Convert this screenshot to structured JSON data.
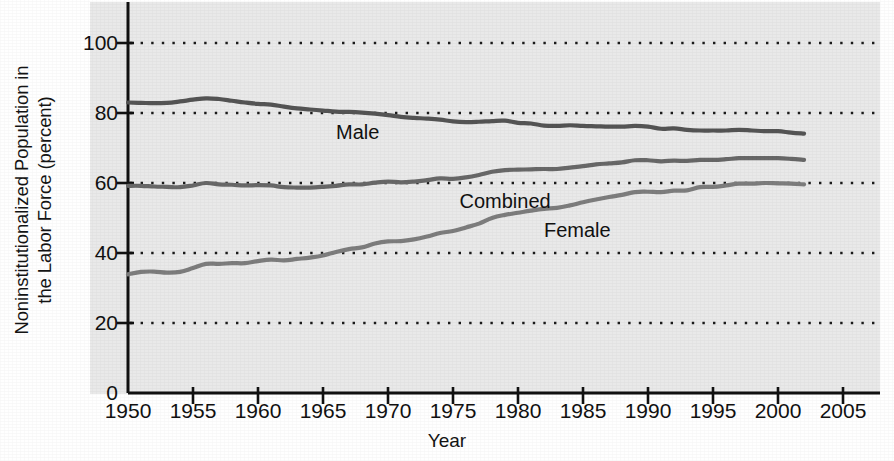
{
  "chart_data": {
    "type": "line",
    "title": "",
    "subtitle": "",
    "xlabel": "Year",
    "ylabel_line1": "Noninstitutionalized Population in",
    "ylabel_line2": "the Labor Force (percent)",
    "ylabel": "Noninstitutionalized Population in the Labor Force (percent)",
    "xlim": [
      1950,
      2005
    ],
    "ylim": [
      0,
      108
    ],
    "xticks": [
      1950,
      1955,
      1960,
      1965,
      1970,
      1975,
      1980,
      1985,
      1990,
      1995,
      2000,
      2005
    ],
    "xtick_labels": [
      "1950",
      "1955",
      "1960",
      "1965",
      "1970",
      "1975",
      "1980",
      "1985",
      "1990",
      "1995",
      "2000",
      "2005"
    ],
    "yticks": [
      0,
      20,
      40,
      60,
      80,
      100
    ],
    "ytick_labels": [
      "0",
      "20",
      "40",
      "60",
      "80",
      "100"
    ],
    "grid": true,
    "grid_style": "dotted",
    "grid_axis": "y",
    "grid_values": [
      20,
      40,
      60,
      80,
      100
    ],
    "legend_position": "inline-annotations",
    "plot_background": "#e9e9e9",
    "figure_background": "#ffffff",
    "x": [
      1950,
      1951,
      1952,
      1953,
      1954,
      1955,
      1956,
      1957,
      1958,
      1959,
      1960,
      1961,
      1962,
      1963,
      1964,
      1965,
      1966,
      1967,
      1968,
      1969,
      1970,
      1971,
      1972,
      1973,
      1974,
      1975,
      1976,
      1977,
      1978,
      1979,
      1980,
      1981,
      1982,
      1983,
      1984,
      1985,
      1986,
      1987,
      1988,
      1989,
      1990,
      1991,
      1992,
      1993,
      1994,
      1995,
      1996,
      1997,
      1998,
      1999,
      2000,
      2001,
      2002
    ],
    "series": [
      {
        "name": "Male",
        "color": "#545454",
        "label_text": "Male",
        "label_x": 1966,
        "label_y": 74.5,
        "values": [
          83.0,
          82.9,
          82.8,
          82.9,
          83.3,
          83.8,
          84.2,
          84.0,
          83.5,
          83.0,
          82.6,
          82.4,
          81.8,
          81.3,
          81.0,
          80.7,
          80.4,
          80.3,
          80.1,
          79.8,
          79.4,
          78.9,
          78.6,
          78.4,
          78.1,
          77.6,
          77.4,
          77.5,
          77.7,
          77.8,
          77.2,
          77.0,
          76.4,
          76.3,
          76.5,
          76.3,
          76.2,
          76.1,
          76.1,
          76.3,
          76.1,
          75.5,
          75.6,
          75.2,
          75.0,
          75.0,
          75.0,
          75.2,
          75.0,
          74.8,
          74.8,
          74.4,
          74.1
        ],
        "style": "solid",
        "linewidth": 4.2
      },
      {
        "name": "Combined",
        "color": "#686868",
        "label_text": "Combined",
        "label_x": 1975.5,
        "label_y": 55.0,
        "values": [
          59.2,
          59.2,
          59.0,
          58.9,
          58.8,
          59.3,
          60.0,
          59.6,
          59.5,
          59.3,
          59.4,
          59.3,
          58.8,
          58.7,
          58.7,
          58.9,
          59.2,
          59.6,
          59.6,
          60.1,
          60.4,
          60.2,
          60.4,
          60.8,
          61.3,
          61.2,
          61.6,
          62.3,
          63.2,
          63.7,
          63.8,
          63.9,
          64.0,
          64.0,
          64.4,
          64.8,
          65.3,
          65.6,
          65.9,
          66.5,
          66.5,
          66.2,
          66.4,
          66.3,
          66.6,
          66.6,
          66.8,
          67.1,
          67.1,
          67.1,
          67.1,
          66.9,
          66.6
        ],
        "style": "solid",
        "linewidth": 4.2
      },
      {
        "name": "Female",
        "color": "#7d7d7d",
        "label_text": "Female",
        "label_x": 1982,
        "label_y": 46.5,
        "values": [
          33.9,
          34.6,
          34.7,
          34.4,
          34.6,
          35.7,
          36.9,
          36.9,
          37.1,
          37.1,
          37.7,
          38.1,
          37.9,
          38.3,
          38.7,
          39.3,
          40.3,
          41.1,
          41.6,
          42.7,
          43.3,
          43.4,
          43.9,
          44.7,
          45.7,
          46.3,
          47.3,
          48.4,
          50.0,
          50.9,
          51.5,
          52.1,
          52.6,
          52.9,
          53.6,
          54.5,
          55.3,
          56.0,
          56.6,
          57.4,
          57.5,
          57.4,
          57.8,
          57.9,
          58.8,
          58.9,
          59.3,
          59.8,
          59.8,
          60.0,
          59.9,
          59.8,
          59.6
        ],
        "style": "solid",
        "linewidth": 4.2
      }
    ]
  }
}
